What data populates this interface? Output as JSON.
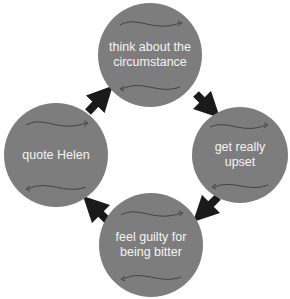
{
  "diagram": {
    "type": "cycle",
    "colors": {
      "node_fill": "#7d7d7d",
      "node_text": "#f4f4f4",
      "arrow": "#1a1a1a"
    },
    "nodes": [
      {
        "id": "top",
        "label": "think about the circumstance"
      },
      {
        "id": "right",
        "label": "get really upset"
      },
      {
        "id": "bottom",
        "label": "feel guilty for being bitter"
      },
      {
        "id": "left",
        "label": "quote Helen"
      }
    ],
    "edges": [
      {
        "from": "top",
        "to": "right"
      },
      {
        "from": "right",
        "to": "bottom"
      },
      {
        "from": "bottom",
        "to": "left"
      },
      {
        "from": "left",
        "to": "top"
      }
    ]
  }
}
